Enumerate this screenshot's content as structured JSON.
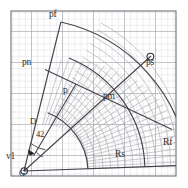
{
  "figure": {
    "background_color": "#ffffff",
    "grid": {
      "visible": true,
      "minor_color": "#c9c9cf",
      "major_color": "#8f8f97",
      "border_color": "#6e6e76",
      "cell_px": 6.2,
      "major_every": 5,
      "x0": 11,
      "y0": 11,
      "x1": 176,
      "y1": 176
    },
    "curve_color": "#4a4a52",
    "mesh_color": "#9a9aa2",
    "outline_color": "#3a3a42",
    "marker_color": "#2a2a2a"
  },
  "labels": {
    "pf": "pf",
    "pn": "pn",
    "p": "p",
    "pm": "pm",
    "ps": "ps",
    "rs": "Rs",
    "rf": "Rf",
    "v1": "v1",
    "g": "G",
    "d": "D",
    "angle42": "42"
  },
  "markers": {
    "ps_point": "circle-marker",
    "g_point": "circle-marker",
    "arrow_head": "arrow-marker"
  },
  "geometry": {
    "apex": {
      "x": 24,
      "y": 171
    },
    "radii": {
      "near": 64,
      "inner": 92,
      "mid": 121,
      "far": 165
    },
    "angles_deg": {
      "start": 2,
      "end": 62
    },
    "angle_annotation_value": 42
  }
}
